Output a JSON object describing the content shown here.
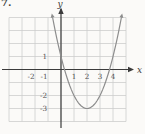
{
  "exercise_number": "7.",
  "figure": {
    "background": "#fbfaf8",
    "colors": {
      "grid": "#cbcbcb",
      "axis": "#3b3b3b",
      "curve": "#8d8d8d",
      "labels": "#4f4f4f"
    }
  },
  "chart_data": {
    "type": "line",
    "function": "y = (x - 2)^2 - 3",
    "vertex": [
      2,
      -3
    ],
    "y_intercept": [
      0,
      1
    ],
    "x_intercepts_approx": [
      0.27,
      3.73
    ],
    "curve_points": [
      [
        -0.65,
        4
      ],
      [
        0,
        1
      ],
      [
        0.27,
        0
      ],
      [
        1,
        -2
      ],
      [
        2,
        -3
      ],
      [
        3,
        -2
      ],
      [
        3.73,
        0
      ],
      [
        4,
        1
      ],
      [
        4.65,
        4
      ]
    ],
    "x_axis": {
      "label": "x",
      "tick_labels": [
        -2,
        -1,
        1,
        2,
        3,
        4
      ],
      "grid_range": [
        -4,
        5
      ]
    },
    "y_axis": {
      "label": "y",
      "tick_labels": [
        1,
        -2,
        -3
      ],
      "grid_range": [
        -4,
        4
      ]
    },
    "grid": true,
    "curve_arrows": "both-upper-ends"
  }
}
